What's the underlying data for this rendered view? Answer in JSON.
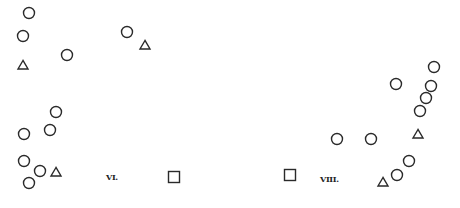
{
  "figure": {
    "width": 460,
    "height": 208,
    "stroke_color": "#2a2a2a",
    "labels": [
      {
        "text": "VI.",
        "x": 106,
        "y": 173
      },
      {
        "text": "VIII.",
        "x": 320,
        "y": 175
      }
    ],
    "circles": [
      {
        "cx": 29,
        "cy": 13
      },
      {
        "cx": 23,
        "cy": 36
      },
      {
        "cx": 67,
        "cy": 55
      },
      {
        "cx": 127,
        "cy": 32
      },
      {
        "cx": 56,
        "cy": 112
      },
      {
        "cx": 50,
        "cy": 130
      },
      {
        "cx": 24,
        "cy": 134
      },
      {
        "cx": 24,
        "cy": 161
      },
      {
        "cx": 40,
        "cy": 171
      },
      {
        "cx": 29,
        "cy": 183
      },
      {
        "cx": 434,
        "cy": 67
      },
      {
        "cx": 396,
        "cy": 84
      },
      {
        "cx": 431,
        "cy": 86
      },
      {
        "cx": 426,
        "cy": 98
      },
      {
        "cx": 420,
        "cy": 111
      },
      {
        "cx": 337,
        "cy": 139
      },
      {
        "cx": 371,
        "cy": 139
      },
      {
        "cx": 409,
        "cy": 161
      },
      {
        "cx": 397,
        "cy": 175
      }
    ],
    "triangles": [
      {
        "cx": 23,
        "cy": 65
      },
      {
        "cx": 145,
        "cy": 45
      },
      {
        "cx": 56,
        "cy": 172
      },
      {
        "cx": 418,
        "cy": 134
      },
      {
        "cx": 383,
        "cy": 182
      }
    ],
    "squares": [
      {
        "cx": 174,
        "cy": 177
      },
      {
        "cx": 290,
        "cy": 175
      }
    ]
  }
}
